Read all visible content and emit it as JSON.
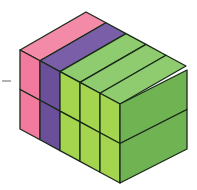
{
  "diagram": {
    "layers": 2,
    "columns": 5,
    "column_colors": [
      "pink",
      "purple",
      "green",
      "green",
      "green"
    ],
    "colors": {
      "pink_front": "#f27a9e",
      "pink_top": "#f28aa8",
      "purple_front": "#6b4f9a",
      "purple_top": "#7a5ea8",
      "green_front": "#a5d44e",
      "green_top": "#8fcc6f",
      "green_side": "#6fb353",
      "edge": "#1a2a1a",
      "dash": "#9a9a9a"
    }
  }
}
